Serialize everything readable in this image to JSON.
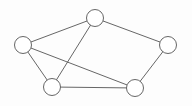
{
  "diagram": {
    "type": "node-link-graph",
    "width": 192,
    "height": 106,
    "background_color": "#fdfdfd",
    "stroke_color": "#555555",
    "node_fill_color": "#ffffff",
    "node_radius": 8.5,
    "stroke_width": 0.9,
    "show_labels": false,
    "directed": false,
    "node_count": 5,
    "edge_count": 7
  },
  "nodes": [
    {
      "id": "n1",
      "name": "top-node",
      "label": "",
      "cx": 95,
      "cy": 18,
      "r": 8.5,
      "degree": 3
    },
    {
      "id": "n2",
      "name": "left-node",
      "label": "",
      "cx": 23,
      "cy": 45,
      "r": 8.5,
      "degree": 3
    },
    {
      "id": "n3",
      "name": "right-node",
      "label": "",
      "cx": 168,
      "cy": 45,
      "r": 8.5,
      "degree": 2
    },
    {
      "id": "n4",
      "name": "bottom-left-node",
      "label": "",
      "cx": 52,
      "cy": 87,
      "r": 8.5,
      "degree": 3
    },
    {
      "id": "n5",
      "name": "bottom-right-node",
      "label": "",
      "cx": 135,
      "cy": 88,
      "r": 8.5,
      "degree": 3
    }
  ],
  "edges": [
    {
      "id": "e1",
      "name": "edge-left-top",
      "source": "n2",
      "target": "n1",
      "x1": 31.0,
      "y1": 40.5,
      "x2": 87.0,
      "y2": 21.4
    },
    {
      "id": "e2",
      "name": "edge-top-right",
      "source": "n1",
      "target": "n3",
      "x1": 103.2,
      "y1": 20.6,
      "x2": 160.0,
      "y2": 42.4
    },
    {
      "id": "e3",
      "name": "edge-right-bottom-right",
      "source": "n3",
      "target": "n5",
      "x1": 164.0,
      "y1": 52.5,
      "x2": 139.0,
      "y2": 80.0
    },
    {
      "id": "e4",
      "name": "edge-bottom-left-bottom-right",
      "source": "n4",
      "target": "n5",
      "x1": 60.5,
      "y1": 87.2,
      "x2": 126.5,
      "y2": 87.8
    },
    {
      "id": "e5",
      "name": "edge-left-bottom-left",
      "source": "n2",
      "target": "n4",
      "x1": 27.5,
      "y1": 52.8,
      "x2": 47.5,
      "y2": 78.8
    },
    {
      "id": "e6",
      "name": "edge-left-bottom-right-diagonal",
      "source": "n2",
      "target": "n5",
      "x1": 31.4,
      "y1": 47.6,
      "x2": 126.8,
      "y2": 85.4
    },
    {
      "id": "e7",
      "name": "edge-top-bottom-left-diagonal",
      "source": "n1",
      "target": "n4",
      "x1": 90.8,
      "y1": 25.4,
      "x2": 56.2,
      "y2": 79.3
    }
  ]
}
